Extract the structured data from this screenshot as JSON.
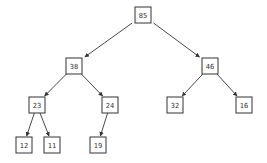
{
  "diagram": {
    "type": "binary-tree (max-heap)",
    "colors": {
      "background": "#ffffff",
      "stroke": "#333333",
      "text": "#333333"
    },
    "box_size": 16,
    "nodes": [
      {
        "id": "n85",
        "label": "85",
        "cx": 143,
        "cy": 15
      },
      {
        "id": "n38",
        "label": "38",
        "cx": 74,
        "cy": 66
      },
      {
        "id": "n46",
        "label": "46",
        "cx": 210,
        "cy": 66
      },
      {
        "id": "n23",
        "label": "23",
        "cx": 37,
        "cy": 105
      },
      {
        "id": "n24",
        "label": "24",
        "cx": 110,
        "cy": 105
      },
      {
        "id": "n32",
        "label": "32",
        "cx": 175,
        "cy": 105
      },
      {
        "id": "n16",
        "label": "16",
        "cx": 244,
        "cy": 105
      },
      {
        "id": "n12",
        "label": "12",
        "cx": 24,
        "cy": 145
      },
      {
        "id": "n11",
        "label": "11",
        "cx": 52,
        "cy": 145
      },
      {
        "id": "n19",
        "label": "19",
        "cx": 98,
        "cy": 145
      }
    ],
    "edges": [
      {
        "from": "n85",
        "to": "n38"
      },
      {
        "from": "n85",
        "to": "n46"
      },
      {
        "from": "n38",
        "to": "n23"
      },
      {
        "from": "n38",
        "to": "n24"
      },
      {
        "from": "n46",
        "to": "n32"
      },
      {
        "from": "n46",
        "to": "n16"
      },
      {
        "from": "n23",
        "to": "n12"
      },
      {
        "from": "n23",
        "to": "n11"
      },
      {
        "from": "n24",
        "to": "n19"
      }
    ]
  }
}
